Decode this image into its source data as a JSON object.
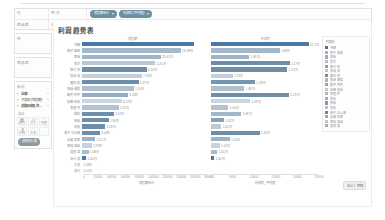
{
  "shelves": {
    "rows_group_label": "行",
    "filters_group_label": "筛选器",
    "rows": [
      {
        "row_label": "行",
        "name": "列 方",
        "pills": [
          {
            "text": "销售额合计",
            "kind": "meas",
            "has_caret": true
          },
          {
            "text": "利润率 (平均值)",
            "kind": "meas",
            "has_caret": true
          }
        ]
      },
      {
        "row_label": "列",
        "name": "行 方",
        "pills": [
          {
            "text": "子类别 名称",
            "kind": "dim",
            "has_caret": true
          }
        ]
      }
    ]
  },
  "sidebar": {
    "cards": [
      {
        "title": "列",
        "blank": true
      },
      {
        "title": "筛选器",
        "blank": true
      }
    ],
    "marks": {
      "title": "标记",
      "rows": [
        {
          "glyph": "▾",
          "label": "全部",
          "bold": true,
          "caret": true
        },
        {
          "glyph": "▾",
          "label": "子类别 (销售额)",
          "bold": false,
          "caret": true
        },
        {
          "glyph": "▾",
          "label": "总和(利润) 名…",
          "bold": true,
          "caret": true
        }
      ],
      "sub_label": "自动",
      "buttons": [
        {
          "glyph": "▦",
          "caption": "颜色"
        },
        {
          "glyph": "◎",
          "caption": "大小"
        },
        {
          "glyph": "⬚",
          "caption": "标签"
        },
        {
          "glyph": "⬆",
          "caption": "详细"
        },
        {
          "glyph": "⬚",
          "caption": "工具"
        }
      ],
      "extra_pill": {
        "text": "总和(利润)",
        "kind": "filt",
        "has_caret": false
      }
    }
  },
  "viz": {
    "title": "利润趋势表",
    "legend": {
      "title": "子类别",
      "items": [
        {
          "label": "书架",
          "color": "#4c78a8"
        },
        {
          "label": "椅子 座椅",
          "color": "#a5b8cb"
        },
        {
          "label": "器具",
          "color": "#9fb5c9"
        },
        {
          "label": "美术",
          "color": "#b9c8d6"
        },
        {
          "label": "装订 机",
          "color": "#8fa8bf"
        },
        {
          "label": "收纳 具",
          "color": "#c3d0dc"
        },
        {
          "label": "复印 机",
          "color": "#7494b0"
        },
        {
          "label": "电话 通信",
          "color": "#aebfd0"
        },
        {
          "label": "配件 附件",
          "color": "#95adc3"
        },
        {
          "label": "标签 贴纸",
          "color": "#cbd6e0"
        },
        {
          "label": "系固 件",
          "color": "#b3c3d3"
        },
        {
          "label": "信封",
          "color": "#a0b6ca"
        },
        {
          "label": "用品",
          "color": "#87a1ba"
        },
        {
          "label": "纸张",
          "color": "#bccbd9"
        },
        {
          "label": "桌子 办公桌",
          "color": "#6e90ad"
        },
        {
          "label": "设备 机器",
          "color": "#9cb3c7"
        },
        {
          "label": "家具 饰品",
          "color": "#c6d2de"
        },
        {
          "label": "其他 类",
          "color": "#a9bccd"
        }
      ]
    },
    "corner_badge": {
      "left": "合计",
      "right": "明细"
    }
  },
  "chart_data": [
    {
      "type": "bar",
      "title": "利润趋势表",
      "orientation": "horizontal",
      "panel": "left",
      "column_header": "销售额",
      "xlabel": "销售额合计",
      "ylabel": "",
      "xlim": [
        0,
        300000
      ],
      "grid": false,
      "tick_labels": [
        "0",
        "20000",
        "40000",
        "60000",
        "80000",
        "100000",
        "120000",
        "140000",
        "160000",
        "180000"
      ],
      "categories": [
        "书架",
        "椅子 座椅",
        "器具",
        "美术",
        "装订 机",
        "收纳 具",
        "复印 机",
        "电话 通信",
        "配件 附件",
        "标签 贴纸",
        "系固 件",
        "信封",
        "用品",
        "纸张",
        "桌子 办公桌",
        "设备 机器",
        "家具 饰品",
        "其他 类",
        "合计 类",
        "汇总",
        "总计"
      ],
      "values": [
        263900,
        234100,
        186200,
        172800,
        152600,
        141300,
        133900,
        122500,
        108700,
        94200,
        86400,
        74900,
        63100,
        54800,
        42600,
        31200,
        23800,
        15400,
        9700,
        0,
        0
      ],
      "data_labels": [
        "",
        "26.39万",
        "23.41万",
        "4.20万",
        "4.10万",
        "7.59万",
        "1.37万",
        "1.10万",
        "3.26万",
        "8.12万",
        "2.41万",
        "2.14万",
        "1.56万",
        "3.18万",
        "3.44万",
        "2.21万",
        "2.97万",
        "1.08万",
        "1.04万",
        "1.08万",
        "1.01万"
      ],
      "highlighted_indices": [
        4,
        6,
        11,
        12,
        13,
        14
      ]
    },
    {
      "type": "bar",
      "panel": "right",
      "column_header": "利润率",
      "xlabel": "利润率_平均值",
      "ylabel": "",
      "xlim": [
        0,
        30000
      ],
      "grid": false,
      "tick_labels": [
        "0",
        "5000",
        "10000",
        "15000",
        "20000",
        "25000"
      ],
      "categories": [
        "书架",
        "椅子 座椅",
        "器具",
        "美术",
        "装订 机",
        "收纳 具",
        "复印 机",
        "电话 通信",
        "配件 附件",
        "标签 贴纸",
        "系固 件",
        "信封",
        "用品",
        "纸张",
        "桌子 办公桌",
        "设备 机器",
        "家具 饰品",
        "其他 类",
        "合计 类",
        "汇总",
        "总计"
      ],
      "values": [
        27800,
        19100,
        10600,
        21900,
        21200,
        6100,
        12300,
        9200,
        21700,
        10900,
        4800,
        8400,
        3600,
        2900,
        13500,
        5200,
        2400,
        1800,
        900,
        0,
        0
      ],
      "data_labels": [
        "22.1万",
        "1.89万",
        "1.06万",
        "2.17万",
        "2.12万",
        "1.19万",
        "1.09万",
        "1.48万",
        "2.13万",
        "1.09万",
        "1.04万",
        "1.08万",
        "1.02万",
        "1.01万",
        "1.35万",
        "1.05万",
        "1.02万",
        "1.01万",
        "1.00万",
        "",
        ""
      ],
      "highlighted_indices": [
        3,
        4,
        8,
        14
      ]
    }
  ]
}
